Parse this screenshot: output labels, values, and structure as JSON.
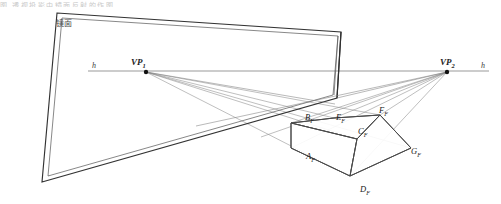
{
  "figure": {
    "title_strip": "图 透视投影中镜面反射的作图",
    "mirror_label": "镜面",
    "horizon_left_label": "h",
    "horizon_right_label": "h",
    "vanishing_points": [
      {
        "name": "vp1",
        "label": "VP",
        "sub": "1",
        "x": 146,
        "y": 72
      },
      {
        "name": "vp2",
        "label": "VP",
        "sub": "2",
        "x": 447,
        "y": 72
      }
    ],
    "box_vertices": [
      {
        "name": "A",
        "label": "A",
        "sub": "F",
        "x": 312,
        "y": 158
      },
      {
        "name": "B",
        "label": "B",
        "sub": "F",
        "x": 311,
        "y": 120
      },
      {
        "name": "C",
        "label": "C",
        "sub": "F",
        "x": 363,
        "y": 133
      },
      {
        "name": "D",
        "label": "D",
        "sub": "F",
        "x": 366,
        "y": 191
      },
      {
        "name": "E",
        "label": "E",
        "sub": "F",
        "x": 341,
        "y": 120
      },
      {
        "name": "F",
        "label": "F",
        "sub": "F",
        "x": 384,
        "y": 112
      },
      {
        "name": "G",
        "label": "G",
        "sub": "F",
        "x": 415,
        "y": 153
      }
    ],
    "colors": {
      "ink": "#1c1c1c",
      "mirror_frame": "#3b3b3b",
      "construction": "#7d7d7d",
      "horizon": "#9a9a9a",
      "box": "#555555",
      "background": "#ffffff"
    }
  },
  "geometry": {
    "horizon_y": 71,
    "horizon_x1": 88,
    "horizon_x2": 489,
    "mirror_outer": "57,13 341,32 337,98 42,182",
    "mirror_inner": "62,18 338,36 333,95 48,176",
    "mirror_right_edge_outer": "341,32 337,98",
    "box": {
      "A": "291,148",
      "B": "291,123",
      "C": "357,139",
      "D": "350,176",
      "E": "334,118",
      "F": "380,115",
      "G": "411,148"
    }
  }
}
